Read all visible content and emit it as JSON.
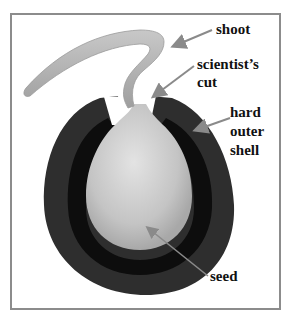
{
  "diagram": {
    "labels": {
      "shoot": "shoot",
      "cut_line1": "scientist’s",
      "cut_line2": "cut",
      "shell_line1": "hard",
      "shell_line2": "outer",
      "shell_line3": "shell",
      "seed": "seed"
    },
    "colors": {
      "frame": "#8c8c8c",
      "shell": "#2e2e2e",
      "shell_inner": "#0d0d0d",
      "seed": "#c9c9c9",
      "shoot": "#b3b3b3",
      "arrow": "#8a8a8a",
      "text": "#111111"
    }
  }
}
